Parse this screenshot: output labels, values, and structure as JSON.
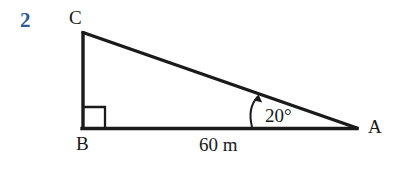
{
  "figure": {
    "question_number": "2",
    "type": "right-triangle-diagram",
    "background_color": "#ffffff",
    "stroke_color": "#1a1a1a",
    "question_number_color": "#2b5c96",
    "vertices": {
      "C": {
        "label": "C",
        "x": 82,
        "y": 32
      },
      "B": {
        "label": "B",
        "x": 82,
        "y": 128
      },
      "A": {
        "label": "A",
        "x": 356,
        "y": 128
      }
    },
    "right_angle": {
      "at_vertex": "B",
      "marker": "square",
      "size": 22
    },
    "angle_annotation": {
      "at_vertex": "A",
      "value": "20°",
      "arrow": "curved-arrow-to-hypotenuse"
    },
    "side_labels": [
      {
        "side": "BA",
        "value": "60",
        "unit": "m",
        "text": "60 m"
      }
    ]
  }
}
